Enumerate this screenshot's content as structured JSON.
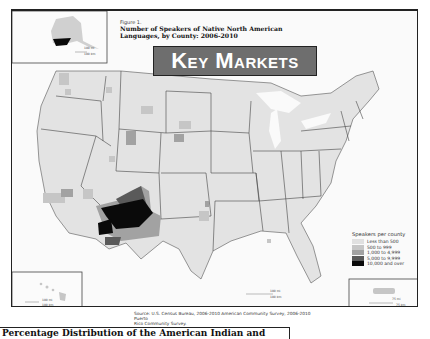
{
  "figure": {
    "label": "Figure 1.",
    "title_line1": "Number of Speakers of Native North American",
    "title_line2": "Languages, by County: 2006-2010"
  },
  "banner": {
    "text": "Key Markets",
    "bg_color": "#6e6e6e",
    "text_color": "#ffffff"
  },
  "legend": {
    "title": "Speakers per county",
    "items": [
      {
        "label": "Less than 500",
        "color": "#e0e0e0"
      },
      {
        "label": "500 to 999",
        "color": "#c6c6c6"
      },
      {
        "label": "1,000 to 4,999",
        "color": "#a2a2a2"
      },
      {
        "label": "5,000 to 9,999",
        "color": "#5a5a5a"
      },
      {
        "label": "10,000 and over",
        "color": "#0a0a0a"
      }
    ]
  },
  "source": {
    "line1": "Source: U.S. Census Bureau, 2006-2010 American Community Survey, 2006-2010 Puerto",
    "line2": "Rico Community Survey."
  },
  "insets": {
    "alaska": {
      "scale_top": "100 mi",
      "scale_bottom": "100 km"
    },
    "hawaii": {
      "scale_top": "100 mi",
      "scale_bottom": "100 km"
    },
    "puerto_rico": {
      "scale_top": "75 mi",
      "scale_bottom": "75 km"
    }
  },
  "main_scale": {
    "top": "100 mi",
    "bottom": "100 km"
  },
  "bottom_heading": "Percentage Distribution of the American Indian and",
  "colors": {
    "land": "#e3e3e3",
    "water": "#fafafa",
    "border": "#333333",
    "frame": "#222222"
  }
}
